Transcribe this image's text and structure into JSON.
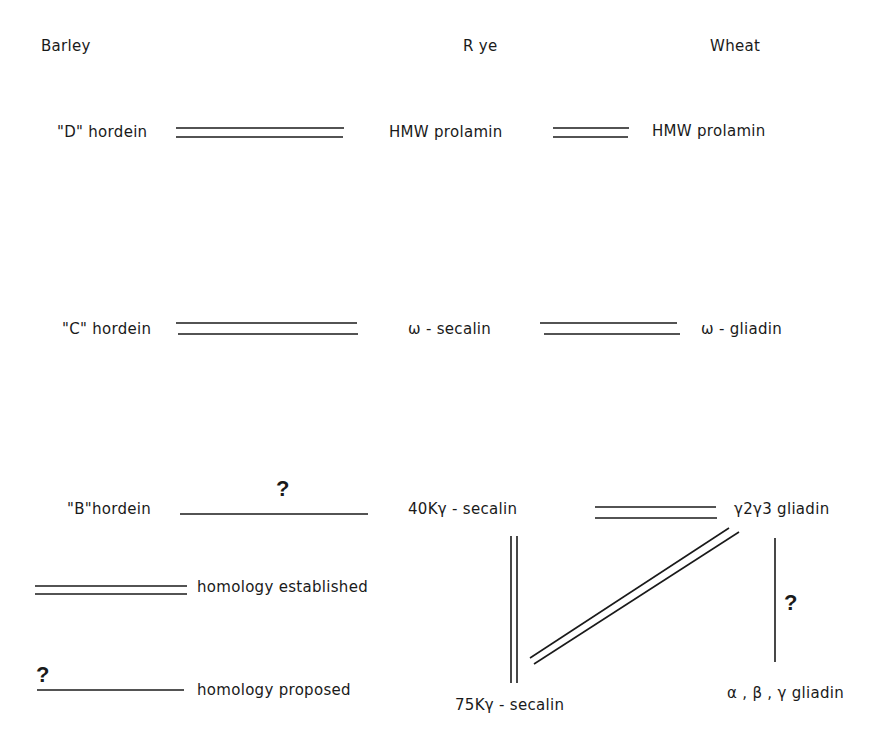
{
  "columns": {
    "barley": "Barley",
    "rye": "R ye",
    "wheat": "Wheat"
  },
  "rows": {
    "d": {
      "barley": "\"D\" hordein",
      "rye": "HMW  prolamin",
      "wheat": "HMW  prolamin",
      "barley_rye_link": "homology established",
      "rye_wheat_link": "homology established"
    },
    "c": {
      "barley": "\"C\" hordein",
      "rye": "ω - secalin",
      "wheat": "ω - gliadin",
      "barley_rye_link": "homology established",
      "rye_wheat_link": "homology established"
    },
    "b": {
      "barley": "\"B\"hordein",
      "rye": "40Kγ - secalin",
      "wheat": "γ2γ3  gliadin",
      "barley_rye_link": "homology proposed",
      "barley_rye_mark": "?",
      "rye_wheat_link": "homology established"
    }
  },
  "lower": {
    "rye": "75Kγ - secalin",
    "wheat": "α , β , γ  gliadin",
    "links": [
      {
        "from": "40Kγ - secalin",
        "to": "75Kγ - secalin",
        "type": "homology established"
      },
      {
        "from": "γ2γ3 gliadin",
        "to": "75Kγ - secalin",
        "type": "homology established"
      },
      {
        "from": "γ2γ3 gliadin",
        "to": "α, β, γ gliadin",
        "type": "homology proposed",
        "mark": "?"
      }
    ],
    "wheat_link_mark": "?"
  },
  "legend": {
    "established": "homology  established",
    "proposed": "homology  proposed",
    "proposed_mark": "?"
  },
  "colors": {
    "ink": "#1a1a1a",
    "background": "#ffffff"
  }
}
